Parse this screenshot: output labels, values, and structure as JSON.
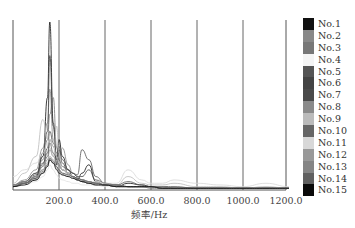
{
  "chart_data": {
    "type": "line",
    "title": "",
    "xlabel": "频率/Hz",
    "ylabel": "",
    "xlim": [
      0,
      1200
    ],
    "x_ticks": [
      "200.0",
      "400.0",
      "600.0",
      "800.0",
      "1000.0",
      "1200.0"
    ],
    "grid": "vertical lines at x ticks",
    "legend_position": "right",
    "x": [
      0,
      50,
      100,
      130,
      150,
      160,
      175,
      190,
      200,
      215,
      240,
      260,
      280,
      300,
      330,
      360,
      400,
      450,
      500,
      560,
      600,
      650,
      700,
      800,
      900,
      1000,
      1100,
      1200
    ],
    "series": [
      {
        "name": "No.1",
        "color": "#111111",
        "values": [
          2,
          4,
          8,
          20,
          55,
          100,
          40,
          15,
          30,
          20,
          12,
          8,
          6,
          10,
          15,
          5,
          3,
          2,
          4,
          3,
          2,
          2,
          1,
          1,
          1,
          1,
          1,
          1
        ]
      },
      {
        "name": "No.2",
        "color": "#888888",
        "values": [
          3,
          6,
          12,
          25,
          40,
          60,
          30,
          20,
          18,
          25,
          15,
          10,
          8,
          6,
          5,
          4,
          3,
          3,
          2,
          2,
          2,
          1,
          1,
          1,
          1,
          1,
          1,
          1
        ]
      },
      {
        "name": "No.3",
        "color": "#777777",
        "values": [
          2,
          5,
          10,
          18,
          30,
          45,
          55,
          25,
          15,
          12,
          10,
          8,
          7,
          6,
          5,
          4,
          3,
          2,
          2,
          2,
          1,
          1,
          1,
          1,
          1,
          1,
          1,
          1
        ]
      },
      {
        "name": "No.4",
        "color": "#f4f4f4",
        "values": [
          2,
          3,
          5,
          8,
          12,
          15,
          12,
          9,
          7,
          6,
          5,
          4,
          4,
          3,
          3,
          3,
          2,
          2,
          2,
          2,
          2,
          1,
          1,
          1,
          1,
          1,
          1,
          1
        ]
      },
      {
        "name": "No.5",
        "color": "#555555",
        "values": [
          3,
          5,
          9,
          15,
          25,
          35,
          28,
          22,
          26,
          18,
          12,
          10,
          9,
          24,
          18,
          8,
          4,
          3,
          5,
          3,
          2,
          2,
          2,
          1,
          1,
          1,
          1,
          1
        ]
      },
      {
        "name": "No.6",
        "color": "#444444",
        "values": [
          2,
          4,
          7,
          22,
          35,
          80,
          38,
          18,
          24,
          16,
          10,
          8,
          7,
          6,
          5,
          4,
          3,
          2,
          2,
          2,
          2,
          1,
          1,
          1,
          1,
          1,
          1,
          1
        ]
      },
      {
        "name": "No.7",
        "color": "#4a4a4a",
        "values": [
          3,
          5,
          10,
          16,
          22,
          30,
          26,
          20,
          18,
          14,
          12,
          10,
          8,
          8,
          12,
          6,
          4,
          3,
          2,
          2,
          2,
          2,
          1,
          1,
          1,
          1,
          1,
          1
        ]
      },
      {
        "name": "No.8",
        "color": "#8a8a8a",
        "values": [
          2,
          4,
          8,
          12,
          18,
          24,
          20,
          16,
          14,
          12,
          10,
          8,
          6,
          5,
          4,
          4,
          3,
          3,
          2,
          2,
          2,
          1,
          1,
          1,
          1,
          1,
          1,
          1
        ]
      },
      {
        "name": "No.9",
        "color": "#bbbbbb",
        "values": [
          4,
          10,
          20,
          42,
          30,
          25,
          20,
          38,
          22,
          14,
          10,
          8,
          6,
          5,
          4,
          4,
          3,
          3,
          8,
          4,
          3,
          3,
          4,
          2,
          2,
          1,
          2,
          1
        ]
      },
      {
        "name": "No.10",
        "color": "#666666",
        "values": [
          2,
          4,
          8,
          14,
          20,
          28,
          22,
          18,
          16,
          12,
          10,
          8,
          6,
          5,
          5,
          4,
          3,
          3,
          2,
          2,
          2,
          1,
          1,
          1,
          1,
          1,
          1,
          1
        ]
      },
      {
        "name": "No.11",
        "color": "#d8d8d8",
        "values": [
          8,
          12,
          16,
          22,
          28,
          30,
          26,
          20,
          16,
          12,
          10,
          8,
          6,
          6,
          5,
          5,
          4,
          4,
          12,
          6,
          4,
          4,
          6,
          4,
          3,
          2,
          4,
          2
        ]
      },
      {
        "name": "No.12",
        "color": "#999999",
        "values": [
          3,
          5,
          8,
          12,
          16,
          20,
          18,
          14,
          12,
          10,
          9,
          8,
          6,
          5,
          4,
          4,
          3,
          3,
          2,
          2,
          2,
          2,
          1,
          1,
          1,
          1,
          1,
          1
        ]
      },
      {
        "name": "No.13",
        "color": "#858585",
        "values": [
          2,
          4,
          6,
          10,
          14,
          18,
          16,
          13,
          11,
          9,
          8,
          7,
          6,
          5,
          4,
          3,
          3,
          2,
          2,
          2,
          2,
          1,
          1,
          1,
          1,
          1,
          1,
          1
        ]
      },
      {
        "name": "No.14",
        "color": "#606060",
        "values": [
          2,
          4,
          7,
          11,
          15,
          19,
          17,
          14,
          12,
          10,
          9,
          8,
          7,
          6,
          5,
          4,
          3,
          3,
          2,
          2,
          2,
          1,
          1,
          1,
          1,
          1,
          1,
          1
        ]
      },
      {
        "name": "No.15",
        "color": "#0a0a0a",
        "values": [
          2,
          3,
          6,
          10,
          14,
          18,
          16,
          12,
          10,
          9,
          8,
          7,
          6,
          5,
          4,
          3,
          3,
          2,
          2,
          2,
          2,
          1,
          1,
          1,
          1,
          1,
          1,
          1
        ]
      }
    ]
  }
}
